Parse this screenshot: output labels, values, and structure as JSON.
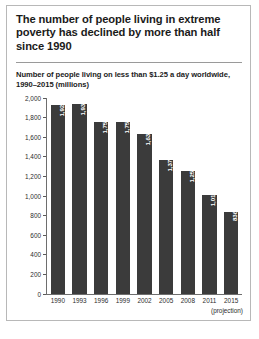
{
  "figure": {
    "title": "The number of people living in extreme poverty has declined by more than half since 1990",
    "subtitle": "Number of people living on less than $1.25 a day worldwide, 1990–2015 (millions)",
    "projection_note": "(projection)",
    "bar_color": "#3b3b3b",
    "background": "#ffffff",
    "border_color": "#b8b8b8"
  },
  "chart_data": {
    "type": "bar",
    "title": "Number of people living on less than $1.25 a day worldwide, 1990–2015 (millions)",
    "xlabel": "",
    "ylabel": "",
    "ylim": [
      0,
      2000
    ],
    "grid": false,
    "legend": null,
    "categories": [
      "1990",
      "1993",
      "1996",
      "1999",
      "2002",
      "2005",
      "2008",
      "2011",
      "2015"
    ],
    "values": [
      1926,
      1939,
      1754,
      1751,
      1632,
      1371,
      1255,
      1011,
      836
    ],
    "value_labels": [
      "1,926",
      "1,939",
      "1,754",
      "1,751",
      "1,632",
      "1,371",
      "1,255",
      "1,011",
      "836"
    ],
    "ytick_labels": [
      "2,000",
      "1,800",
      "1,600",
      "1,400",
      "1,200",
      "1,000",
      "800",
      "600",
      "400",
      "200",
      "0"
    ],
    "ytick_values": [
      2000,
      1800,
      1600,
      1400,
      1200,
      1000,
      800,
      600,
      400,
      200,
      0
    ],
    "annotations": [
      "(projection)"
    ]
  }
}
